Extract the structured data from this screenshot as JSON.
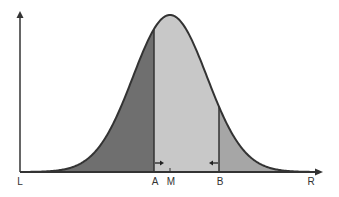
{
  "diagram": {
    "type": "normal-distribution",
    "colors": {
      "left_region": "#6f6f6f",
      "middle_region": "#c8c8c8",
      "right_region": "#a6a6a6",
      "curve": "#333333",
      "axes": "#333333"
    },
    "labels": {
      "L": "L",
      "A": "A",
      "M": "M",
      "B": "B",
      "R": "R"
    },
    "markers": [
      {
        "name": "A",
        "x": 154,
        "arrow": "right"
      },
      {
        "name": "B",
        "x": 219,
        "arrow": "left"
      }
    ],
    "mean_label": "M",
    "curve": {
      "center_x": 170,
      "sigma_px": 37,
      "baseline_y": 172,
      "peak_y": 15
    }
  }
}
